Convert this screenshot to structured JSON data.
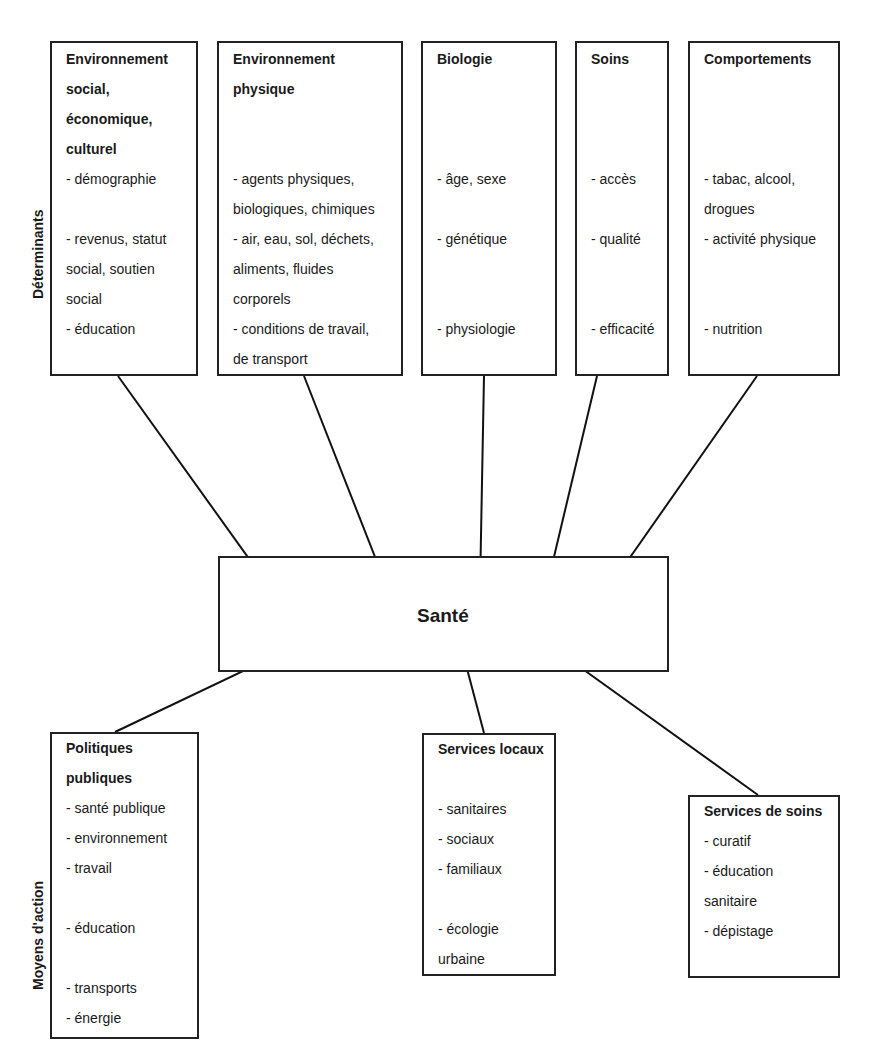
{
  "side_labels": {
    "determinants": "Déterminants",
    "moyens_action": "Moyens d'action"
  },
  "center": {
    "label": "Santé"
  },
  "determinants": [
    {
      "title_lines": [
        "Environnement",
        "social,",
        "économique,",
        "culturel"
      ],
      "items": [
        {
          "row": 4,
          "text": "- démographie"
        },
        {
          "row": 6,
          "text": "- revenus, statut"
        },
        {
          "row": 7,
          "text": "social, soutien"
        },
        {
          "row": 8,
          "text": "social"
        },
        {
          "row": 9,
          "text": "- éducation"
        }
      ]
    },
    {
      "title_lines": [
        "Environnement",
        "physique"
      ],
      "items": [
        {
          "row": 4,
          "text": "- agents physiques,"
        },
        {
          "row": 5,
          "text": "biologiques, chimiques"
        },
        {
          "row": 6,
          "text": "- air, eau, sol, déchets,"
        },
        {
          "row": 7,
          "text": "aliments, fluides"
        },
        {
          "row": 8,
          "text": "corporels"
        },
        {
          "row": 9,
          "text": "- conditions de travail,"
        },
        {
          "row": 10,
          "text": "de transport"
        }
      ]
    },
    {
      "title_lines": [
        "Biologie"
      ],
      "items": [
        {
          "row": 4,
          "text": "- âge, sexe"
        },
        {
          "row": 6,
          "text": "- génétique"
        },
        {
          "row": 9,
          "text": "- physiologie"
        }
      ]
    },
    {
      "title_lines": [
        "Soins"
      ],
      "items": [
        {
          "row": 4,
          "text": "- accès"
        },
        {
          "row": 6,
          "text": "- qualité"
        },
        {
          "row": 9,
          "text": "- efficacité"
        }
      ]
    },
    {
      "title_lines": [
        "Comportements"
      ],
      "items": [
        {
          "row": 4,
          "text": "- tabac, alcool,"
        },
        {
          "row": 5,
          "text": "drogues"
        },
        {
          "row": 6,
          "text": "- activité physique"
        },
        {
          "row": 9,
          "text": "- nutrition"
        }
      ]
    }
  ],
  "moyens_action": [
    {
      "title_lines": [
        "Politiques",
        "publiques"
      ],
      "items": [
        {
          "row": 2,
          "text": "- santé publique"
        },
        {
          "row": 3,
          "text": "- environnement"
        },
        {
          "row": 4,
          "text": "- travail"
        },
        {
          "row": 6,
          "text": "- éducation"
        },
        {
          "row": 8,
          "text": "- transports"
        },
        {
          "row": 9,
          "text": "- énergie"
        }
      ]
    },
    {
      "title_lines": [
        "Services locaux"
      ],
      "items": [
        {
          "row": 2,
          "text": "- sanitaires"
        },
        {
          "row": 3,
          "text": "- sociaux"
        },
        {
          "row": 4,
          "text": "- familiaux"
        },
        {
          "row": 6,
          "text": "- écologie"
        },
        {
          "row": 7,
          "text": "urbaine"
        }
      ]
    },
    {
      "title_lines": [
        "Services de soins"
      ],
      "items": [
        {
          "row": 1,
          "text": "- curatif"
        },
        {
          "row": 2,
          "text": "- éducation"
        },
        {
          "row": 3,
          "text": "sanitaire"
        },
        {
          "row": 4,
          "text": "- dépistage"
        }
      ]
    }
  ],
  "arrows": [
    {
      "from": "determinant-0",
      "x1": 118,
      "y1": 376,
      "x2": 270,
      "y2": 588
    },
    {
      "from": "determinant-1",
      "x1": 304,
      "y1": 376,
      "x2": 388,
      "y2": 590
    },
    {
      "from": "determinant-2",
      "x1": 484,
      "y1": 376,
      "x2": 480,
      "y2": 589
    },
    {
      "from": "determinant-3",
      "x1": 597,
      "y1": 376,
      "x2": 548,
      "y2": 582
    },
    {
      "from": "determinant-4",
      "x1": 757,
      "y1": 376,
      "x2": 603,
      "y2": 596
    },
    {
      "from": "moyen-0",
      "x1": 115,
      "y1": 732,
      "x2": 287,
      "y2": 650
    },
    {
      "from": "moyen-1",
      "x1": 484,
      "y1": 733,
      "x2": 461,
      "y2": 646
    },
    {
      "from": "moyen-2",
      "x1": 758,
      "y1": 795,
      "x2": 559,
      "y2": 652
    }
  ]
}
